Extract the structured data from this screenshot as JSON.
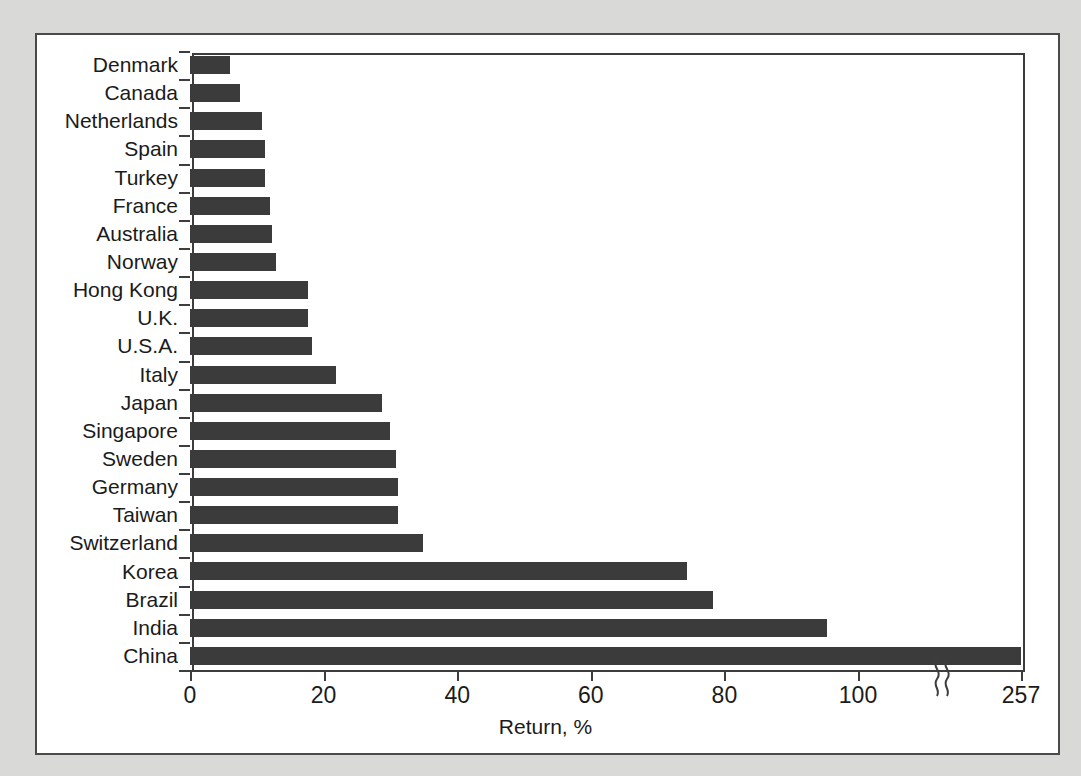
{
  "figure": {
    "background_color": "#d9d9d7",
    "card_color": "#ffffff",
    "border_color": "#4a4a4a",
    "bar_color": "#3b3b3b",
    "axis_color": "#3d3d3d",
    "text_color": "#1b1b1b"
  },
  "axis_break": {
    "present": true,
    "symbol": "squiggle",
    "position_value": 112
  },
  "chart_data": {
    "type": "bar",
    "orientation": "horizontal",
    "title": "",
    "subtitle": "",
    "xlabel": "Return, %",
    "ylabel": "",
    "xlim": [
      0,
      115
    ],
    "xticks": [
      0,
      20,
      40,
      60,
      80,
      100
    ],
    "xticklabels": [
      "0",
      "20",
      "40",
      "60",
      "80",
      "100",
      "257"
    ],
    "grid": false,
    "legend": false,
    "axis_break_after": 100,
    "max_label": "257",
    "categories": [
      "Denmark",
      "Canada",
      "Netherlands",
      "Spain",
      "Turkey",
      "France",
      "Australia",
      "Norway",
      "Hong Kong",
      "U.K.",
      "U.S.A.",
      "Italy",
      "Japan",
      "Singapore",
      "Sweden",
      "Germany",
      "Taiwan",
      "Switzerland",
      "Korea",
      "Brazil",
      "India",
      "China"
    ],
    "values": [
      6,
      7.5,
      10.8,
      11.2,
      11.3,
      12,
      12.3,
      12.8,
      17.6,
      17.7,
      18.2,
      21.9,
      28.7,
      30,
      30.8,
      31.2,
      31.2,
      34.9,
      74.4,
      78.3,
      95.4,
      257
    ]
  }
}
